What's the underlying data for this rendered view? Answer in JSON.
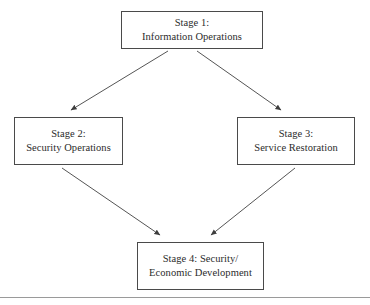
{
  "diagram": {
    "background_color": "#ffffff",
    "box_border_color": "#4a4a4a",
    "arrow_color": "#555555",
    "text_color": "#2b2b2b",
    "nodes": [
      {
        "id": "stage1",
        "label_line1": "Stage 1:",
        "label_line2": "Information Operations"
      },
      {
        "id": "stage2",
        "label_line1": "Stage 2:",
        "label_line2": "Security Operations"
      },
      {
        "id": "stage3",
        "label_line1": "Stage 3:",
        "label_line2": "Service Restoration"
      },
      {
        "id": "stage4",
        "label_line1": "Stage 4: Security/",
        "label_line2": "Economic Development"
      }
    ],
    "edges": [
      {
        "id": "edge-stage1-stage2",
        "from": "stage1",
        "to": "stage2",
        "marker": "solid-triangle-arrowhead"
      },
      {
        "id": "edge-stage1-stage3",
        "from": "stage1",
        "to": "stage3",
        "marker": "solid-triangle-arrowhead"
      },
      {
        "id": "edge-stage2-stage4",
        "from": "stage2",
        "to": "stage4",
        "marker": "solid-triangle-arrowhead"
      },
      {
        "id": "edge-stage3-stage4",
        "from": "stage3",
        "to": "stage4",
        "marker": "solid-triangle-arrowhead"
      }
    ],
    "footer_rule": {
      "id": "footer-rule",
      "color": "#9a9a9a"
    }
  }
}
